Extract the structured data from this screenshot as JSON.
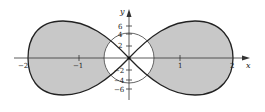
{
  "diagram": {
    "type": "polar-region-plot",
    "colors": {
      "shade": "#c8c8c8",
      "curve": "#222222",
      "axis": "#333333",
      "background": "#ffffff"
    },
    "axes": {
      "x_label": "x",
      "y_label": "y",
      "x_ticks": [
        {
          "value": -2,
          "label": "−2"
        },
        {
          "value": -1,
          "label": "−1"
        },
        {
          "value": 1,
          "label": "1"
        },
        {
          "value": 2,
          "label": "2"
        }
      ],
      "y_ticks": [
        {
          "value": 6,
          "label": "6"
        },
        {
          "value": 4,
          "label": "4"
        },
        {
          "value": 2,
          "label": "2"
        },
        {
          "value": -2,
          "label": "−2"
        },
        {
          "value": -4,
          "label": "−4"
        },
        {
          "value": -6,
          "label": "−6"
        }
      ]
    },
    "labels": {
      "x_axis": "x",
      "y_axis": "y",
      "xt_m2": "−2",
      "xt_m1": "−1",
      "xt_1": "1",
      "xt_2": "2",
      "yt_6": "6",
      "yt_4": "4",
      "yt_2": "2",
      "yt_m2": "−2",
      "yt_m4": "−4",
      "yt_m6": "−6"
    }
  }
}
